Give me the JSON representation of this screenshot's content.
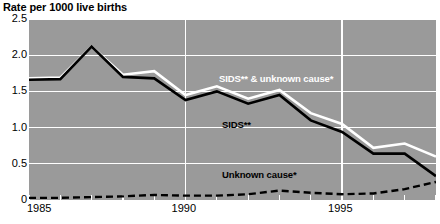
{
  "chart_data": {
    "type": "line",
    "title": "Rate per 1000 live births",
    "xlabel": "",
    "ylabel": "Rate per 1000 live births",
    "xlim": [
      1985,
      1998
    ],
    "ylim": [
      0,
      2.5
    ],
    "ytick_labels": [
      "2.5",
      "2.0",
      "1.5",
      "1.0",
      "0.5",
      "0"
    ],
    "ytick_values": [
      2.5,
      2.0,
      1.5,
      1.0,
      0.5,
      0
    ],
    "xtick_labels": [
      "1985",
      "1990",
      "1995"
    ],
    "xtick_values": [
      1985,
      1990,
      1995
    ],
    "grid": true,
    "legend_position": "inline-annotations",
    "x": [
      1985,
      1986,
      1987,
      1988,
      1989,
      1990,
      1991,
      1992,
      1993,
      1994,
      1995,
      1996,
      1997,
      1998
    ],
    "series": [
      {
        "name": "SIDS** & unknown cause*",
        "style": "solid",
        "color": "#ffffff",
        "values": [
          1.68,
          1.69,
          2.12,
          1.73,
          1.78,
          1.45,
          1.57,
          1.4,
          1.52,
          1.2,
          1.05,
          0.72,
          0.78,
          0.6
        ]
      },
      {
        "name": "SIDS**",
        "style": "solid",
        "color": "#000000",
        "values": [
          1.66,
          1.67,
          2.12,
          1.7,
          1.68,
          1.38,
          1.5,
          1.33,
          1.45,
          1.1,
          0.94,
          0.64,
          0.64,
          0.33
        ]
      },
      {
        "name": "Unknown cause*",
        "style": "dashed",
        "color": "#000000",
        "values": [
          0.03,
          0.03,
          0.04,
          0.05,
          0.07,
          0.06,
          0.06,
          0.08,
          0.13,
          0.1,
          0.08,
          0.09,
          0.15,
          0.25
        ]
      }
    ],
    "annotations": [
      {
        "text": "SIDS** & unknown cause*",
        "color": "#ffffff"
      },
      {
        "text": "SIDS**",
        "color": "#000000"
      },
      {
        "text": "Unknown cause*",
        "color": "#000000"
      }
    ]
  }
}
